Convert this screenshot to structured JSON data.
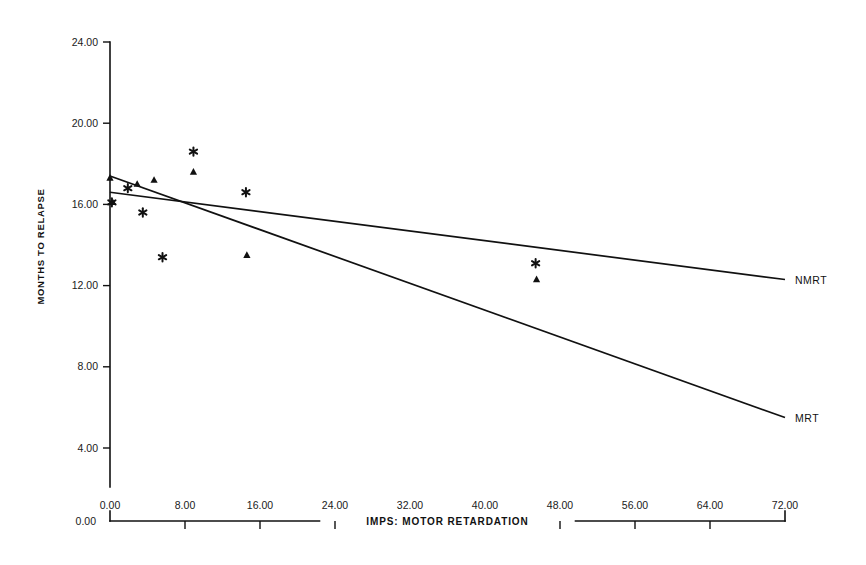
{
  "chart_data": {
    "type": "scatter",
    "title": "",
    "xlabel": "IMPS:  MOTOR RETARDATION",
    "ylabel": "MONTHS TO RELAPSE",
    "xlim": [
      0,
      72
    ],
    "ylim": [
      0,
      24
    ],
    "grid": false,
    "legend_position": "right-inline-line-labels",
    "xticks": [
      "0.00",
      "8.00",
      "16.00",
      "24.00",
      "32.00",
      "40.00",
      "48.00",
      "56.00",
      "64.00",
      "72.00"
    ],
    "xtick_values": [
      0,
      8,
      16,
      24,
      32,
      40,
      48,
      56,
      64,
      72
    ],
    "yticks": [
      "24.00",
      "20.00",
      "16.00",
      "12.00",
      "8.00",
      "4.00"
    ],
    "ytick_values": [
      24,
      20,
      16,
      12,
      8,
      4
    ],
    "origin_label": "0.00",
    "series": [
      {
        "name": "MRT",
        "marker": "triangle",
        "points": [
          {
            "x": 0.0,
            "y": 17.3
          },
          {
            "x": 0.3,
            "y": 16.1
          },
          {
            "x": 2.9,
            "y": 17.0
          },
          {
            "x": 4.7,
            "y": 17.2
          },
          {
            "x": 8.9,
            "y": 17.6
          },
          {
            "x": 14.6,
            "y": 13.5
          },
          {
            "x": 45.5,
            "y": 12.3
          }
        ]
      },
      {
        "name": "NMRT",
        "marker": "asterisk",
        "points": [
          {
            "x": 0.2,
            "y": 16.1
          },
          {
            "x": 1.9,
            "y": 16.8
          },
          {
            "x": 3.5,
            "y": 15.6
          },
          {
            "x": 5.6,
            "y": 13.4
          },
          {
            "x": 8.9,
            "y": 18.6
          },
          {
            "x": 14.5,
            "y": 16.6
          },
          {
            "x": 45.4,
            "y": 13.1
          }
        ]
      }
    ],
    "fit_lines": [
      {
        "name": "MRT",
        "label": "MRT",
        "x_start": 0.0,
        "y_start": 17.4,
        "x_end": 72.0,
        "y_end": 5.5
      },
      {
        "name": "NMRT",
        "label": "NMRT",
        "x_start": 0.0,
        "y_start": 16.6,
        "x_end": 72.0,
        "y_end": 12.3
      }
    ]
  }
}
